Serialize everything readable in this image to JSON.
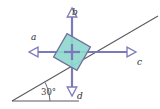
{
  "figure": {
    "width": 160,
    "height": 109,
    "background_color": "#ffffff"
  },
  "incline": {
    "angle_label": "30°",
    "angle_value": 30,
    "line_color": "#5a5a62",
    "baseline_color": "#5a5a62"
  },
  "block": {
    "fill_color": "#8fd8ce",
    "edge_color": "#6f6f9c",
    "rotation_deg": 30,
    "size_px": 27
  },
  "vectors": [
    {
      "id": "a",
      "label": "a",
      "direction": "left",
      "color": "#7b79b8",
      "head": "open"
    },
    {
      "id": "b",
      "label": "b",
      "direction": "up",
      "color": "#7b79b8",
      "head": "open"
    },
    {
      "id": "c",
      "label": "c",
      "direction": "right",
      "color": "#7b79b8",
      "head": "open"
    },
    {
      "id": "d",
      "label": "d",
      "direction": "down",
      "color": "#7b79b8",
      "head": "open"
    }
  ]
}
